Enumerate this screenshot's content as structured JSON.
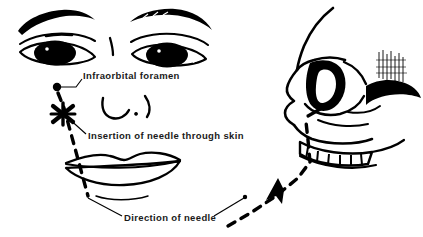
{
  "figure": {
    "background_color": "#ffffff",
    "ink_color": "#000000",
    "width": 423,
    "height": 237
  },
  "labels": {
    "foramen": "Infraorbital  foramen",
    "insertion": "Insertion of  needle through skin",
    "direction": "Direction of  needle"
  },
  "anatomy": {
    "frontal_view": {
      "name": "anterior face view",
      "parts": [
        "left-eyebrow",
        "right-eyebrow",
        "left-eye",
        "right-eye",
        "nose",
        "upper-lip",
        "lower-lip"
      ]
    },
    "lateral_view": {
      "name": "lateral skull view",
      "parts": [
        "frontal-bone",
        "nasal-bone",
        "orbit",
        "zygomatic-arch",
        "maxilla",
        "upper-teeth",
        "infraorbital-foramen"
      ]
    }
  },
  "markers": {
    "foramen_dot": "black dot marking infraorbital foramen",
    "insertion_x": "X marking needle insertion point through skin",
    "needle_path": "dashed line indicating needle trajectory",
    "arrowhead": "arrow showing direction of needle advance"
  }
}
